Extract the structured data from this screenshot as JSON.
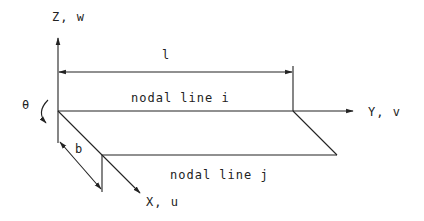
{
  "diagram": {
    "type": "finite-strip-coordinate-system",
    "colors": {
      "stroke": "#222222",
      "background": "#ffffff"
    },
    "axes": {
      "z": {
        "label": "Z, w"
      },
      "y": {
        "label": "Y, v"
      },
      "x": {
        "label": "X, u"
      }
    },
    "rotation": {
      "label": "θ"
    },
    "dimensions": {
      "length": {
        "label": "l"
      },
      "width": {
        "label": "b"
      }
    },
    "nodal_lines": [
      {
        "id": "i",
        "label": "nodal line i"
      },
      {
        "id": "j",
        "label": "nodal line j"
      }
    ]
  }
}
